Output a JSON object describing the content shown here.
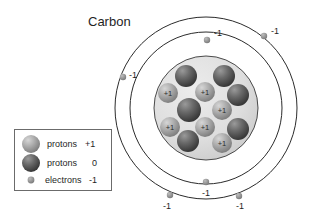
{
  "diagram": {
    "title": "Carbon",
    "type": "bohr-atom-model",
    "center": {
      "x": 206,
      "y": 108
    },
    "shells": [
      {
        "name": "outer-shell",
        "radius": 91
      },
      {
        "name": "inner-shell",
        "radius": 76
      }
    ],
    "nucleus": {
      "radius": 52,
      "particles": [
        {
          "kind": "neutron",
          "label": "",
          "x": 186,
          "y": 76,
          "r": 11
        },
        {
          "kind": "neutron",
          "label": "",
          "x": 224,
          "y": 76,
          "r": 11
        },
        {
          "kind": "proton",
          "label": "+1",
          "x": 168,
          "y": 93,
          "r": 10
        },
        {
          "kind": "proton",
          "label": "+1",
          "x": 205,
          "y": 92,
          "r": 10
        },
        {
          "kind": "neutron",
          "label": "",
          "x": 238,
          "y": 95,
          "r": 11
        },
        {
          "kind": "neutron",
          "label": "",
          "x": 189,
          "y": 110,
          "r": 12
        },
        {
          "kind": "proton",
          "label": "+1",
          "x": 222,
          "y": 110,
          "r": 10
        },
        {
          "kind": "proton",
          "label": "+1",
          "x": 170,
          "y": 127,
          "r": 10
        },
        {
          "kind": "proton",
          "label": "+1",
          "x": 205,
          "y": 127,
          "r": 10
        },
        {
          "kind": "neutron",
          "label": "",
          "x": 238,
          "y": 129,
          "r": 11
        },
        {
          "kind": "neutron",
          "label": "",
          "x": 188,
          "y": 141,
          "r": 11
        },
        {
          "kind": "proton",
          "label": "+1",
          "x": 222,
          "y": 143,
          "r": 10
        }
      ]
    },
    "electrons": [
      {
        "name": "electron-inner-top",
        "label": "-1",
        "x": 207,
        "y": 40,
        "lx": 214,
        "ly": 34,
        "r": 3
      },
      {
        "name": "electron-outer-top-right",
        "label": "-1",
        "x": 264,
        "y": 36,
        "lx": 272,
        "ly": 34,
        "r": 3
      },
      {
        "name": "electron-outer-left",
        "label": "-1",
        "x": 123,
        "y": 77,
        "lx": 130,
        "ly": 76,
        "r": 3
      },
      {
        "name": "electron-inner-bottom",
        "label": "-1",
        "x": 206,
        "y": 182,
        "lx": 206,
        "ly": 195,
        "r": 3
      },
      {
        "name": "electron-outer-bottom-left",
        "label": "-1",
        "x": 170,
        "y": 195,
        "lx": 166,
        "ly": 208,
        "r": 3
      },
      {
        "name": "electron-outer-bottom-right",
        "label": "-1",
        "x": 239,
        "y": 196,
        "lx": 239,
        "ly": 208,
        "r": 3
      }
    ]
  },
  "legend": {
    "box": {
      "x": 14,
      "y": 129,
      "width": 97,
      "height": 61
    },
    "items": [
      {
        "swatch": "proton-sphere-light",
        "name": "protons",
        "charge": "+1"
      },
      {
        "swatch": "neutron-sphere-dark",
        "name": "protons",
        "charge": "0"
      },
      {
        "swatch": "electron-dot",
        "name": "electrons",
        "charge": "-1"
      }
    ]
  },
  "colors": {
    "stroke": "#2b2b2b",
    "nucleus_fill": "#dcdcdc",
    "proton_light": "#b4b4b4",
    "neutron_dark": "#5a5a5a",
    "electron": "#8e8e8e",
    "text": "#1f1f1f",
    "legend_border": "#6b6b6b"
  }
}
